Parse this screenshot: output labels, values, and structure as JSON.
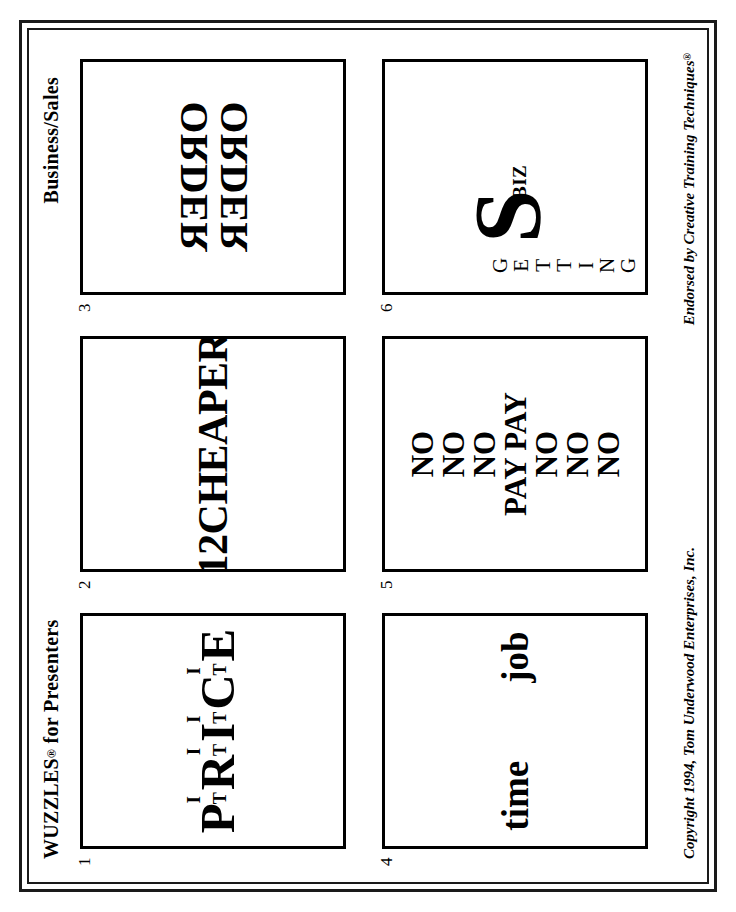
{
  "page": {
    "header_left": "WUZZLES",
    "header_left_mark": "®",
    "header_left_suffix": " for Presenters",
    "header_right": "Business/Sales",
    "footer_left": "Copyright 1994, Tom Underwood Enterprises, Inc.",
    "footer_right": "Endorsed by Creative Training Techniques",
    "footer_right_mark": "®",
    "border_color": "#1a1a1a",
    "ink_color": "#000000",
    "paper_color": "#ffffff"
  },
  "puzzles": [
    {
      "number": "1",
      "kind": "price-it",
      "big_letters": [
        "P",
        "R",
        "I",
        "C",
        "E"
      ],
      "small_upper": "I",
      "small_lower": "T",
      "reading": "P I T R I T I I T C I T E"
    },
    {
      "number": "2",
      "kind": "text",
      "text": "12CHEAPER"
    },
    {
      "number": "3",
      "kind": "mirrored-stack",
      "lines": [
        "ORDER",
        "ORDER"
      ]
    },
    {
      "number": "4",
      "kind": "two-words",
      "word_left": "time",
      "word_right": "job"
    },
    {
      "number": "5",
      "kind": "stack",
      "lines": [
        "NO",
        "NO",
        "NO",
        "PAY PAY",
        "NO",
        "NO",
        "NO"
      ]
    },
    {
      "number": "6",
      "kind": "getting-s-biz",
      "letters": [
        "G",
        "E",
        "T",
        "T",
        "I",
        "N",
        "G"
      ],
      "s_letter": "S",
      "biz_text": "BIZ"
    }
  ]
}
